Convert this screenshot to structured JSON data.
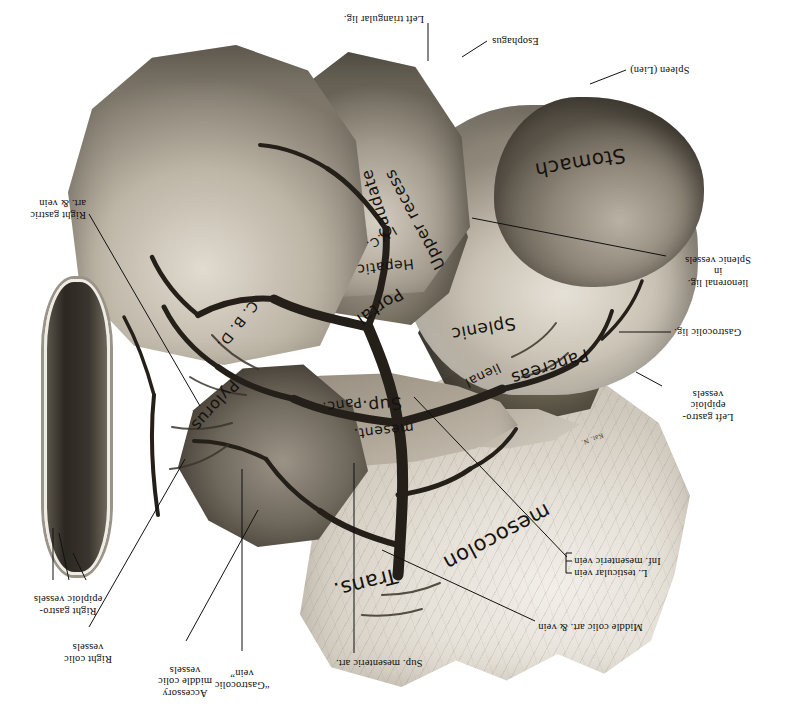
{
  "figure": {
    "orientation_note": "plate printed upside-down (rotated 180°)",
    "medium": "grayscale halftone anatomical illustration",
    "signature": "Kat. N.",
    "colors": {
      "background": "#ffffff",
      "ink": "#0d0d0d",
      "tissue_light": "#e4dfd6",
      "tissue_mid": "#a49c8e",
      "tissue_dark": "#423d35",
      "vessel": "#2a2620"
    }
  },
  "callouts": [
    {
      "id": "sup-mesenteric-art",
      "lines": [
        "Sup. mesenteric art."
      ]
    },
    {
      "id": "gastrocolic-vein",
      "lines": [
        "“Gastrocolic",
        "vein”"
      ]
    },
    {
      "id": "accessory-middle-colic-vessels",
      "lines": [
        "Accessory",
        "middle colic",
        "vessels"
      ]
    },
    {
      "id": "right-colic-vessels",
      "lines": [
        "Right colic",
        "vessels"
      ]
    },
    {
      "id": "right-gastroepiploic-vessels",
      "lines": [
        "Right gastro-",
        "epiploic vessels"
      ]
    },
    {
      "id": "middle-colic-art-vein",
      "lines": [
        "Middle colic art. & vein"
      ]
    },
    {
      "id": "inf-mesenteric-vein",
      "lines": [
        "Inf. mesenteric vein"
      ]
    },
    {
      "id": "l-testicular-vein",
      "lines": [
        "L. testicular vein"
      ]
    },
    {
      "id": "left-gastroepiploic-vessels",
      "lines": [
        "Left gastro-",
        "epiploic",
        "vessels"
      ]
    },
    {
      "id": "gastrocolic-lig",
      "lines": [
        "Gastrocolic lig."
      ]
    },
    {
      "id": "splenic-vessels-lienorenal",
      "lines": [
        "Splenic vessels",
        "in",
        "lienorenal lig."
      ]
    },
    {
      "id": "right-gastric-art-vein",
      "lines": [
        "Right gastric",
        "art. & vein"
      ]
    },
    {
      "id": "spleen-lien",
      "lines": [
        "Spleen (Lien)"
      ]
    },
    {
      "id": "esophagus",
      "lines": [
        "Esophagus"
      ]
    },
    {
      "id": "left-triangular-lig",
      "lines": [
        "Left triangular lig."
      ]
    }
  ],
  "in_figure_labels": [
    {
      "id": "trans",
      "text": "Trans."
    },
    {
      "id": "mesocolon",
      "text": "mesocolon"
    },
    {
      "id": "sup-mesent",
      "text": "Sup."
    },
    {
      "id": "sup-mesent-2",
      "text": "mesent."
    },
    {
      "id": "pancreas",
      "text": "Pancreas"
    },
    {
      "id": "lienal",
      "text": "lienal"
    },
    {
      "id": "splenic",
      "text": "Splenic"
    },
    {
      "id": "portal",
      "text": "Portal"
    },
    {
      "id": "hepatic",
      "text": "Hepatic"
    },
    {
      "id": "panc",
      "text": "Panc."
    },
    {
      "id": "pylorus",
      "text": "Pylorus"
    },
    {
      "id": "cbd",
      "text": "C. B. D."
    },
    {
      "id": "ivc",
      "text": "I.V.C."
    },
    {
      "id": "upper-recess",
      "text": "Upper recess"
    },
    {
      "id": "caudate",
      "text": "Caudate"
    },
    {
      "id": "stomach",
      "text": "Stomach"
    }
  ]
}
